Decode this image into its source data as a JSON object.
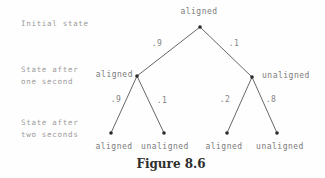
{
  "caption": "Figure 8.6",
  "rows": [
    {
      "line1": "Initial state",
      "line2": ""
    },
    {
      "line1": "State after",
      "line2": "one second"
    },
    {
      "line1": "State after",
      "line2": "two seconds"
    }
  ],
  "tree": {
    "root": {
      "label": "aligned"
    },
    "branches": [
      {
        "prob": ".9",
        "node": "aligned",
        "children": [
          {
            "prob": ".9",
            "node": "aligned"
          },
          {
            "prob": ".1",
            "node": "unaligned"
          }
        ]
      },
      {
        "prob": ".1",
        "node": "unaligned",
        "children": [
          {
            "prob": ".2",
            "node": "aligned"
          },
          {
            "prob": ".8",
            "node": "unaligned"
          }
        ]
      }
    ]
  }
}
